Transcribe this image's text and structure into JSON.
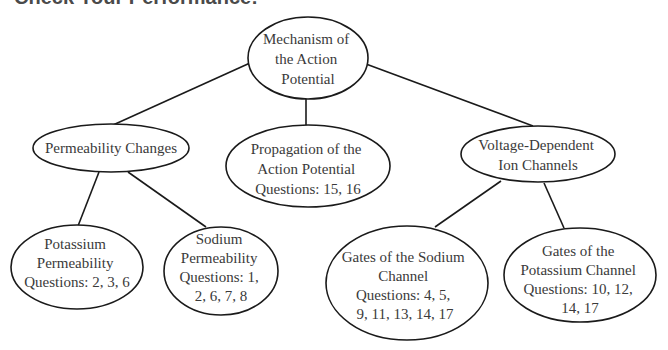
{
  "heading": "Check Your Performance:",
  "colors": {
    "stroke": "#1a1a1a",
    "text": "#3a3a3a",
    "background": "#ffffff"
  },
  "nodes": [
    {
      "id": "mechanism",
      "lines": [
        "Mechanism of",
        "the Action",
        "Potential"
      ]
    },
    {
      "id": "permeability",
      "lines": [
        "Permeability Changes"
      ]
    },
    {
      "id": "propagation",
      "lines": [
        "Propagation of the",
        "Action Potential",
        "Questions: 15, 16"
      ]
    },
    {
      "id": "voltage",
      "lines": [
        "Voltage-Dependent",
        "Ion Channels"
      ]
    },
    {
      "id": "potassium-perm",
      "lines": [
        "Potassium",
        "Permeability",
        "Questions: 2, 3, 6"
      ]
    },
    {
      "id": "sodium-perm",
      "lines": [
        "Sodium",
        "Permeability",
        "Questions: 1,",
        "2, 6, 7, 8"
      ]
    },
    {
      "id": "gates-sodium",
      "lines": [
        "Gates of the Sodium",
        "Channel",
        "Questions: 4, 5,",
        "9, 11, 13, 14, 17"
      ]
    },
    {
      "id": "gates-potassium",
      "lines": [
        "Gates of the",
        "Potassium Channel",
        "Questions: 10, 12,",
        "14, 17"
      ]
    }
  ],
  "edges": [
    [
      "mechanism",
      "permeability"
    ],
    [
      "mechanism",
      "propagation"
    ],
    [
      "mechanism",
      "voltage"
    ],
    [
      "permeability",
      "potassium-perm"
    ],
    [
      "permeability",
      "sodium-perm"
    ],
    [
      "voltage",
      "gates-sodium"
    ],
    [
      "voltage",
      "gates-potassium"
    ]
  ]
}
